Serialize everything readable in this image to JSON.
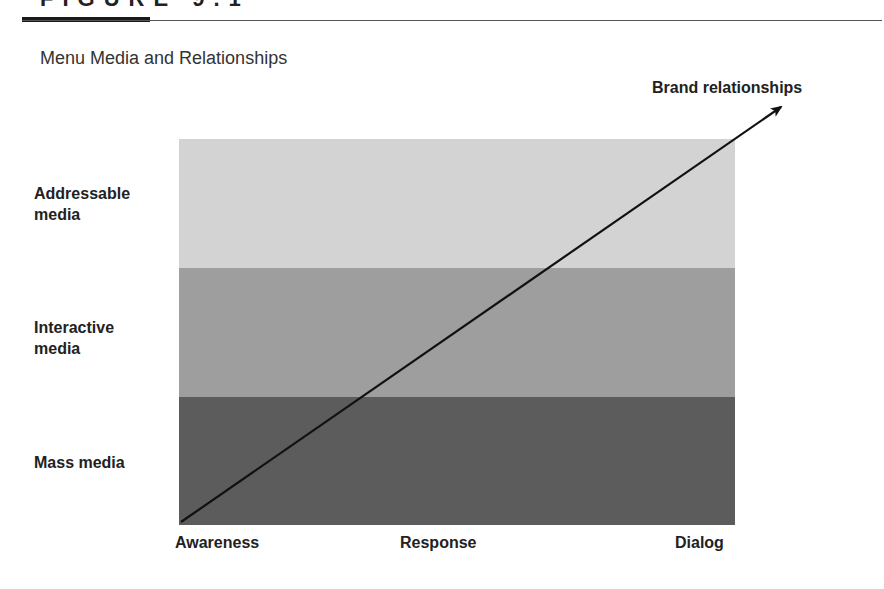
{
  "figure": {
    "label": "FIGURE 9.1",
    "title": "Menu Media and Relationships"
  },
  "diagram": {
    "rows": [
      {
        "label_line1": "Addressable",
        "label_line2": "media",
        "color": "#d3d3d3"
      },
      {
        "label_line1": "Interactive",
        "label_line2": "media",
        "color": "#9e9e9e"
      },
      {
        "label_line1": "Mass media",
        "label_line2": "",
        "color": "#5c5c5c"
      }
    ],
    "columns": [
      "Awareness",
      "Response",
      "Dialog"
    ],
    "arrow": {
      "label": "Brand relationships",
      "from": "Awareness / Mass media",
      "to": "Dialog / Addressable media"
    }
  }
}
